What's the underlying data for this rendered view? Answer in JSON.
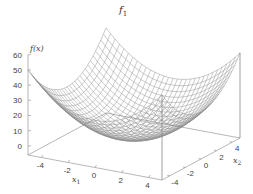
{
  "chart_data": {
    "type": "surface3d",
    "title_main": "f",
    "title_sub": "1",
    "function": "x1^2 + x2^2",
    "xlabel": "x_1",
    "ylabel": "x_2",
    "zlabel": "f(x)",
    "x_range": [
      -5,
      5
    ],
    "y_range": [
      -5,
      5
    ],
    "z_range": [
      0,
      60
    ],
    "x_ticks": [
      "-4",
      "-2",
      "0",
      "2",
      "4"
    ],
    "y_ticks": [
      "-4",
      "-2",
      "0",
      "2",
      "4"
    ],
    "z_ticks": [
      "0",
      "10",
      "20",
      "30",
      "40",
      "50",
      "60"
    ],
    "grid_resolution": 31,
    "mesh_color": "#8a8a8a",
    "axis_color": "#888888"
  },
  "labels": {
    "title_main": "f",
    "title_sub": "1",
    "zlabel": "f(x)",
    "xlabel_main": "x",
    "xlabel_sub": "1",
    "ylabel_main": "x",
    "ylabel_sub": "2"
  }
}
